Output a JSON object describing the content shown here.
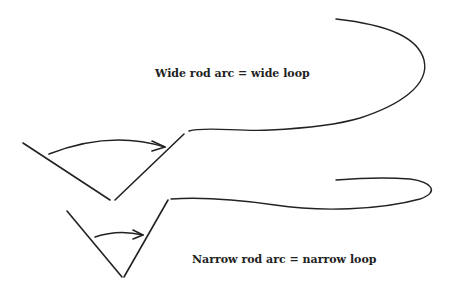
{
  "diagram": {
    "labels": {
      "wide": "Wide rod arc = wide loop",
      "narrow": "Narrow rod arc = narrow loop"
    },
    "colors": {
      "stroke": "#222222",
      "background": "#ffffff"
    },
    "elements": [
      {
        "id": "wide-rod-arc",
        "type": "v-shape-with-arrow",
        "description": "Wide V rod arc with curved arrow"
      },
      {
        "id": "wide-loop",
        "type": "line-loop",
        "description": "Wide casting loop"
      },
      {
        "id": "narrow-rod-arc",
        "type": "v-shape-with-arrow",
        "description": "Narrow V rod arc with curved arrow"
      },
      {
        "id": "narrow-loop",
        "type": "line-loop",
        "description": "Narrow casting loop"
      }
    ]
  }
}
